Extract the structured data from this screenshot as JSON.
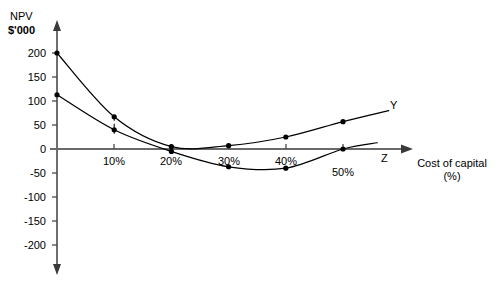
{
  "chart_data": {
    "type": "line",
    "title": "",
    "ylabel_lines": [
      "NPV",
      "$'000"
    ],
    "xlabel_lines": [
      "Cost of capital",
      "(%)"
    ],
    "xlabel": "Cost of capital (%)",
    "ylabel": "NPV $'000",
    "grid": false,
    "legend_position": "inline-right-end",
    "xlim": [
      0,
      58
    ],
    "ylim": [
      -215,
      215
    ],
    "yticks": [
      200,
      150,
      100,
      50,
      0,
      -50,
      -100,
      -150,
      -200
    ],
    "ytick_labels": [
      "200",
      "150",
      "100",
      "50",
      "0",
      "-50",
      "-100",
      "-150",
      "-200"
    ],
    "xticks": [
      10,
      20,
      30,
      40,
      50
    ],
    "xtick_labels": [
      "10%",
      "20%",
      "30%",
      "40%",
      "50%"
    ],
    "annotations": [
      {
        "name": "dashed-drop-line",
        "x": 10,
        "y_from": 67,
        "y_to": 40,
        "style": "dashed"
      }
    ],
    "series": [
      {
        "name": "Y",
        "label": "Y",
        "color": "#000000",
        "marker": "circle",
        "x": [
          0,
          10,
          20,
          30,
          40,
          50
        ],
        "values": [
          200,
          67,
          5,
          7,
          25,
          57
        ],
        "curve_end": {
          "x": 58,
          "y": 80
        }
      },
      {
        "name": "Z",
        "label": "Z",
        "color": "#000000",
        "marker": "circle",
        "x": [
          0,
          10,
          20,
          30,
          40,
          50
        ],
        "values": [
          113,
          40,
          -5,
          -37,
          -40,
          0
        ],
        "curve_end": {
          "x": 56,
          "y": 13
        }
      }
    ]
  },
  "axes": {
    "y_axis_name": "npv-value-axis",
    "x_axis_name": "cost-of-capital-axis"
  }
}
